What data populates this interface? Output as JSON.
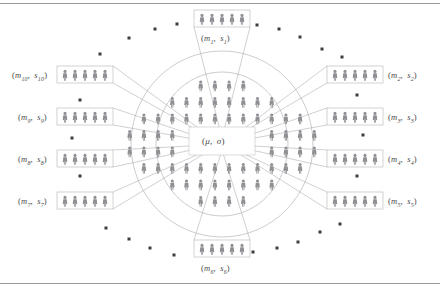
{
  "figure": {
    "center_label": "(μ, σ)",
    "center_label_mu": "μ",
    "center_label_sigma": "σ",
    "population_icon_color": "#8f8f94",
    "box_border_color": "#b4b4b8",
    "line_color": "#a9a9ad",
    "ellipse_color": "#a9a9ad",
    "dot_color": "#3d3d3d",
    "rule_color": "#9a9a9a",
    "icon_count_per_sample_box": 5
  },
  "samples": [
    {
      "id": "s1",
      "label_m": "m",
      "sub": "1",
      "label_s": "s",
      "label": "(m₁, s₁)",
      "position": "top",
      "side": "top",
      "box_x": 194,
      "box_y": 10,
      "box_w": 56,
      "box_h": 17,
      "lbl_x": 201,
      "lbl_y": 33
    },
    {
      "id": "s2",
      "label_m": "m",
      "sub": "2",
      "label_s": "s",
      "label": "(m₂, s₂)",
      "position": "upper-right",
      "side": "right",
      "box_x": 327,
      "box_y": 66,
      "box_w": 56,
      "box_h": 17,
      "lbl_x": 388,
      "lbl_y": 70
    },
    {
      "id": "s3",
      "label_m": "m",
      "sub": "3",
      "label_s": "s",
      "label": "(m₃, s₃)",
      "position": "right-upper",
      "side": "right",
      "box_x": 327,
      "box_y": 108,
      "box_w": 56,
      "box_h": 17,
      "lbl_x": 388,
      "lbl_y": 112
    },
    {
      "id": "s4",
      "label_m": "m",
      "sub": "4",
      "label_s": "s",
      "label": "(m₄, s₄)",
      "position": "right-lower",
      "side": "right",
      "box_x": 327,
      "box_y": 150,
      "box_w": 56,
      "box_h": 17,
      "lbl_x": 388,
      "lbl_y": 154
    },
    {
      "id": "s5",
      "label_m": "m",
      "sub": "5",
      "label_s": "s",
      "label": "(m₅, s₅)",
      "position": "lower-right",
      "side": "right",
      "box_x": 327,
      "box_y": 192,
      "box_w": 56,
      "box_h": 17,
      "lbl_x": 388,
      "lbl_y": 196
    },
    {
      "id": "s6",
      "label_m": "m",
      "sub": "6",
      "label_s": "s",
      "label": "(m₆, s₆)",
      "position": "bottom",
      "side": "bottom",
      "box_x": 194,
      "box_y": 240,
      "box_w": 56,
      "box_h": 17,
      "lbl_x": 201,
      "lbl_y": 263
    },
    {
      "id": "s7",
      "label_m": "m",
      "sub": "7",
      "label_s": "s",
      "label": "(m₇, s₇)",
      "position": "lower-left",
      "side": "left",
      "box_x": 57,
      "box_y": 192,
      "box_w": 56,
      "box_h": 17,
      "lbl_x": 18,
      "lbl_y": 196
    },
    {
      "id": "s8",
      "label_m": "m",
      "sub": "8",
      "label_s": "s",
      "label": "(m₈, s₈)",
      "position": "left-lower",
      "side": "left",
      "box_x": 57,
      "box_y": 150,
      "box_w": 56,
      "box_h": 17,
      "lbl_x": 18,
      "lbl_y": 154
    },
    {
      "id": "s9",
      "label_m": "m",
      "sub": "9",
      "label_s": "s",
      "label": "(m₉, s₉)",
      "position": "left-upper",
      "side": "left",
      "box_x": 57,
      "box_y": 108,
      "box_w": 56,
      "box_h": 17,
      "lbl_x": 18,
      "lbl_y": 112
    },
    {
      "id": "s10",
      "label_m": "m",
      "sub": "10",
      "label_s": "s",
      "label": "(m₁₀, s₁₀)",
      "position": "upper-left",
      "side": "left",
      "box_x": 57,
      "box_y": 66,
      "box_w": 56,
      "box_h": 17,
      "lbl_x": 12,
      "lbl_y": 70
    }
  ],
  "scatter_dots": [
    {
      "x": 100,
      "y": 54
    },
    {
      "x": 129,
      "y": 38
    },
    {
      "x": 155,
      "y": 29
    },
    {
      "x": 177,
      "y": 24
    },
    {
      "x": 257,
      "y": 25
    },
    {
      "x": 279,
      "y": 29
    },
    {
      "x": 300,
      "y": 37
    },
    {
      "x": 322,
      "y": 49
    },
    {
      "x": 342,
      "y": 57
    },
    {
      "x": 80,
      "y": 100
    },
    {
      "x": 72,
      "y": 138
    },
    {
      "x": 80,
      "y": 176
    },
    {
      "x": 357,
      "y": 95
    },
    {
      "x": 363,
      "y": 135
    },
    {
      "x": 357,
      "y": 176
    },
    {
      "x": 106,
      "y": 228
    },
    {
      "x": 129,
      "y": 239
    },
    {
      "x": 150,
      "y": 248
    },
    {
      "x": 174,
      "y": 255
    },
    {
      "x": 253,
      "y": 252
    },
    {
      "x": 277,
      "y": 248
    },
    {
      "x": 298,
      "y": 242
    },
    {
      "x": 320,
      "y": 232
    },
    {
      "x": 340,
      "y": 224
    }
  ],
  "center_cluster": {
    "rows": [
      4,
      8,
      12,
      14,
      14,
      12,
      8,
      4
    ],
    "outer_ellipse": {
      "cx": 222,
      "cy": 144,
      "rx": 91,
      "ry": 93
    },
    "inner_ellipse": {
      "cx": 222,
      "cy": 144,
      "rx": 66,
      "ry": 72
    },
    "center_box": {
      "x": 189,
      "y": 127,
      "w": 66,
      "h": 28
    }
  }
}
